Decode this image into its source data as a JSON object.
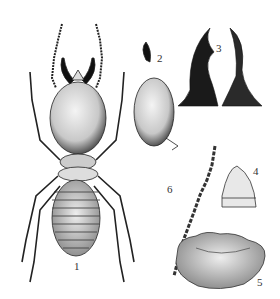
{
  "plate": {
    "figures": [
      {
        "number": "1",
        "subject": "soldier-whole-body"
      },
      {
        "number": "2",
        "subject": "head-lateral"
      },
      {
        "number": "3",
        "subject": "mandibles"
      },
      {
        "number": "4",
        "subject": "labrum"
      },
      {
        "number": "5",
        "subject": "pronotum"
      },
      {
        "number": "6",
        "subject": "antenna"
      }
    ],
    "colors": {
      "ink": "#1a1a1a",
      "paper": "#ffffff"
    }
  }
}
